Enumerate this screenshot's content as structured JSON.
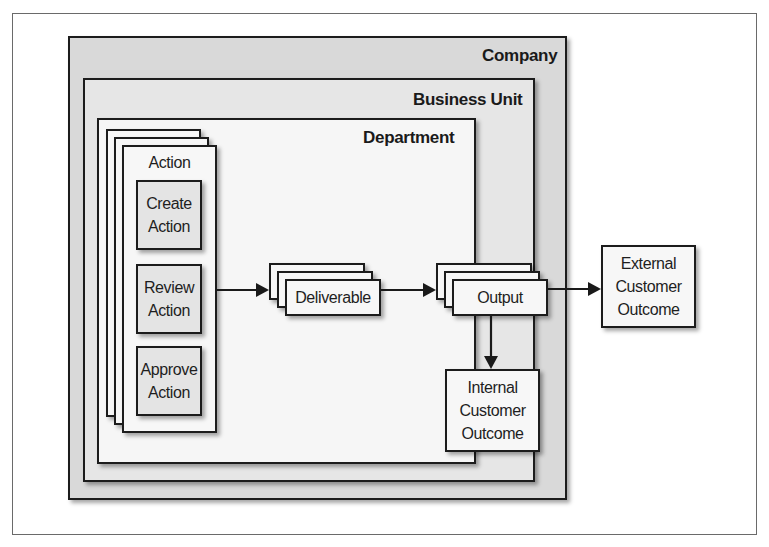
{
  "diagram": {
    "regions": {
      "company": "Company",
      "business_unit": "Business Unit",
      "department": "Department"
    },
    "action_group": {
      "title": "Action",
      "steps": [
        {
          "label_line1": "Create",
          "label_line2": "Action"
        },
        {
          "label_line1": "Review",
          "label_line2": "Action"
        },
        {
          "label_line1": "Approve",
          "label_line2": "Action"
        }
      ]
    },
    "deliverable": "Deliverable",
    "output": "Output",
    "external_outcome": {
      "line1": "External",
      "line2": "Customer",
      "line3": "Outcome"
    },
    "internal_outcome": {
      "line1": "Internal",
      "line2": "Customer",
      "line3": "Outcome"
    },
    "flows": [
      {
        "from": "Action",
        "to": "Deliverable"
      },
      {
        "from": "Deliverable",
        "to": "Output"
      },
      {
        "from": "Output",
        "to": "External Customer Outcome"
      },
      {
        "from": "Output",
        "to": "Internal Customer Outcome"
      }
    ],
    "colors": {
      "company_fill": "#d9d9d9",
      "business_unit_fill": "#e6e6e6",
      "department_fill": "#f6f6f6",
      "stroke": "#1c1c1c"
    }
  }
}
